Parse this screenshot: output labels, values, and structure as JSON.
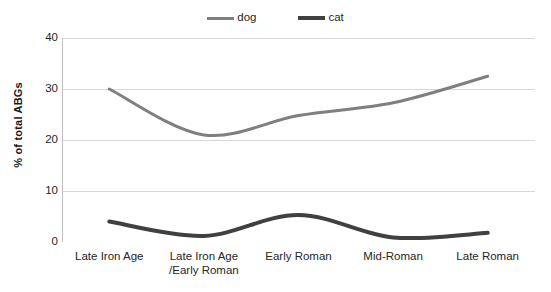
{
  "chart_data": {
    "type": "line",
    "title": "",
    "xlabel": "",
    "ylabel": "% of total ABGs",
    "ylim": [
      0,
      40
    ],
    "yticks": [
      0,
      10,
      20,
      30,
      40
    ],
    "grid": "horizontal",
    "legend_position": "top-center",
    "categories": [
      "Late Iron Age",
      "Late Iron Age /Early Roman",
      "Early Roman",
      "Mid-Roman",
      "Late Roman"
    ],
    "category_lines": [
      [
        "Late Iron Age",
        ""
      ],
      [
        "Late Iron Age",
        "/Early Roman"
      ],
      [
        "Early Roman",
        ""
      ],
      [
        "Mid-Roman",
        ""
      ],
      [
        "Late Roman",
        ""
      ]
    ],
    "series": [
      {
        "name": "dog",
        "color": "#7f7f7f",
        "line_width": 3,
        "values": [
          30.0,
          21.0,
          24.8,
          27.3,
          32.5
        ]
      },
      {
        "name": "cat",
        "color": "#404040",
        "line_width": 4,
        "values": [
          4.0,
          1.2,
          5.3,
          0.9,
          1.8
        ]
      }
    ]
  },
  "legend": {
    "items": [
      {
        "label": "dog"
      },
      {
        "label": "cat"
      }
    ]
  },
  "axis": {
    "y_title": "% of total ABGs",
    "y_tick_labels": [
      "40",
      "30",
      "20",
      "10",
      "0"
    ]
  },
  "colors": {
    "dog": "#7f7f7f",
    "cat": "#404040",
    "gridline": "#d9d9d9",
    "axis": "#bfbfbf",
    "text": "#262626",
    "background": "#ffffff"
  }
}
